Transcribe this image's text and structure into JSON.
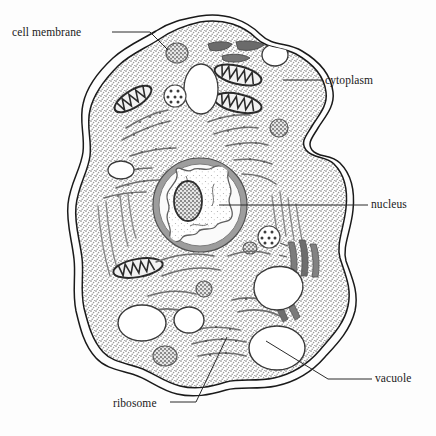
{
  "diagram": {
    "type": "labeled-biological-diagram",
    "background_color": "#fdfdfd",
    "line_color": "#1a1a1a",
    "cytoplasm_fill": "#d8d8d8",
    "nucleus_envelope_color": "#8c8c8c",
    "organelle_dark": "#6e6e6e",
    "vacuole_fill": "#ffffff"
  },
  "labels": [
    {
      "id": "cell-membrane",
      "text": "cell membrane",
      "position": "top-left",
      "leader_from": [
        112,
        32
      ],
      "leader_to": [
        160,
        48
      ]
    },
    {
      "id": "cytoplasm",
      "text": "cytoplasm",
      "position": "right-upper",
      "leader_from": [
        322,
        80
      ],
      "leader_to": [
        283,
        80
      ]
    },
    {
      "id": "nucleus",
      "text": "nucleus",
      "position": "right-middle",
      "leader_from": [
        368,
        205
      ],
      "leader_to": [
        219,
        205
      ]
    },
    {
      "id": "vacuole",
      "text": "vacuole",
      "position": "right-lower",
      "leader_from": [
        372,
        379
      ],
      "leader_to": [
        266,
        341
      ]
    },
    {
      "id": "ribosome",
      "text": "ribosome",
      "position": "bottom-left",
      "leader_from": [
        170,
        402
      ],
      "leader_to": [
        226,
        338
      ]
    }
  ],
  "structures": {
    "cell_membrane": {
      "name": "cell membrane",
      "style": "double-line outline, wavy lobed amoeboid shape with deep notch on right side"
    },
    "cytoplasm": {
      "name": "cytoplasm",
      "style": "stippled light gray fill filling cell interior"
    },
    "nucleus": {
      "name": "nucleus",
      "center": [
        200,
        205
      ],
      "radius": 47,
      "style": "thick gray envelope ring, pale interior with irregular chromatin network"
    },
    "nucleolus": {
      "name": "nucleolus",
      "center": [
        188,
        201
      ],
      "rx": 14,
      "ry": 20,
      "style": "dark oval with granular texture inside nucleus"
    },
    "mitochondria": {
      "name": "mitochondria",
      "count": 4,
      "style": "elongated ovals with zigzag cristae"
    },
    "vacuoles": {
      "name": "vacuoles",
      "count": 6,
      "style": "white unfilled rounded blobs"
    },
    "endoplasmic_reticulum": {
      "name": "endoplasmic reticulum",
      "style": "thin curved strands with attached ribosome dots"
    },
    "ribosomes": {
      "name": "ribosomes",
      "style": "small dark dots along ER strands and free in cytoplasm"
    },
    "lysosomes": {
      "name": "lysosomes",
      "style": "small round granular gray bodies"
    },
    "golgi": {
      "name": "golgi apparatus",
      "style": "stacked dark curved bars at right"
    }
  }
}
